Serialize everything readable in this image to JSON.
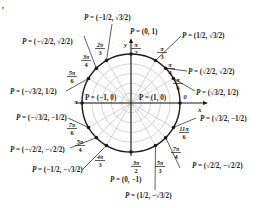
{
  "diagram": {
    "colors": {
      "ink": "#1a1a1a",
      "grid": "#b8b8b8",
      "background": "#ffffff"
    },
    "center": {
      "x": 131,
      "y": 103
    },
    "radius": 49,
    "axes": {
      "x_label": "x",
      "y_label": "y"
    },
    "corner_mark": ",",
    "points": [
      {
        "angle_deg": 0,
        "angle_label": "0",
        "point_label": "P = (1, 0)",
        "num": "0",
        "den": "",
        "px": "1",
        "py": "0"
      },
      {
        "angle_deg": 30,
        "angle_label": "π/6",
        "point_label": "P = (√3/2, 1/2)",
        "num": "π",
        "den": "6",
        "px": "√3/2",
        "py": "1/2"
      },
      {
        "angle_deg": 45,
        "angle_label": "π/4",
        "point_label": "P = (√2/2, √2/2)",
        "num": "π",
        "den": "4",
        "px": "√2/2",
        "py": "√2/2"
      },
      {
        "angle_deg": 60,
        "angle_label": "π/3",
        "point_label": "P = (1/2, √3/2)",
        "num": "π",
        "den": "3",
        "px": "1/2",
        "py": "√3/2"
      },
      {
        "angle_deg": 90,
        "angle_label": "π/2",
        "point_label": "P = (0, 1)",
        "num": "π",
        "den": "2",
        "px": "0",
        "py": "1"
      },
      {
        "angle_deg": 120,
        "angle_label": "2π/3",
        "point_label": "P = (−1/2, √3/2)",
        "num": "2π",
        "den": "3",
        "px": "−1/2",
        "py": "√3/2"
      },
      {
        "angle_deg": 135,
        "angle_label": "3π/4",
        "point_label": "P = (−√2/2, √2/2)",
        "num": "3π",
        "den": "4",
        "px": "−√2/2",
        "py": "√2/2"
      },
      {
        "angle_deg": 150,
        "angle_label": "5π/6",
        "point_label": "P = (−√3/2, 1/2)",
        "num": "5π",
        "den": "6",
        "px": "−√3/2",
        "py": "1/2"
      },
      {
        "angle_deg": 180,
        "angle_label": "π",
        "point_label": "P = (−1, 0)",
        "num": "π",
        "den": "",
        "px": "−1",
        "py": "0"
      },
      {
        "angle_deg": 210,
        "angle_label": "7π/6",
        "point_label": "P = (−√3/2, −1/2)",
        "num": "7π",
        "den": "6",
        "px": "−√3/2",
        "py": "−1/2"
      },
      {
        "angle_deg": 225,
        "angle_label": "5π/4",
        "point_label": "P = (−√2/2, −√2/2)",
        "num": "5π",
        "den": "4",
        "px": "−√2/2",
        "py": "−√2/2"
      },
      {
        "angle_deg": 240,
        "angle_label": "4π/3",
        "point_label": "P = (−1/2, −√3/2)",
        "num": "4π",
        "den": "3",
        "px": "−1/2",
        "py": "−√3/2"
      },
      {
        "angle_deg": 270,
        "angle_label": "3π/2",
        "point_label": "P = (0, −1)",
        "num": "3π",
        "den": "2",
        "px": "0",
        "py": "−1"
      },
      {
        "angle_deg": 300,
        "angle_label": "5π/3",
        "point_label": "P = (1/2, −√3/2)",
        "num": "5π",
        "den": "3",
        "px": "1/2",
        "py": "−√3/2"
      },
      {
        "angle_deg": 315,
        "angle_label": "7π/4",
        "point_label": "P = (√2/2, −√2/2)",
        "num": "7π",
        "den": "4",
        "px": "√2/2",
        "py": "−√2/2"
      },
      {
        "angle_deg": 330,
        "angle_label": "11π/6",
        "point_label": "P = (√3/2, −1/2)",
        "num": "11π",
        "den": "6",
        "px": "√3/2",
        "py": "−1/2"
      }
    ],
    "inner_labels": {
      "left": "P = (−1, 0)",
      "right": "P = (1, 0)"
    }
  }
}
